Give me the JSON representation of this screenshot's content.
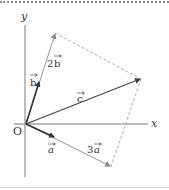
{
  "diagram": {
    "type": "vector-decomposition",
    "axes": {
      "x_label": "x",
      "y_label": "y",
      "origin_label": "O"
    },
    "vectors": [
      {
        "name": "a",
        "label": "a",
        "role": "unit vector a"
      },
      {
        "name": "b",
        "label": "b",
        "role": "unit vector b"
      },
      {
        "name": "3a",
        "label": "3a",
        "coef": "3",
        "base": "a"
      },
      {
        "name": "2b",
        "label": "2b",
        "coef": "2",
        "base": "b"
      },
      {
        "name": "c",
        "label": "c",
        "role": "resultant c = 3a + 2b"
      }
    ],
    "labels": {
      "a_base": "a",
      "b_base": "b",
      "three": "3",
      "two": "2",
      "c": "c"
    },
    "colors": {
      "axis": "#7a7a7a",
      "vector_dark": "#333333",
      "vector_light": "#8a8a8a",
      "dashed": "#9a9a9a"
    }
  }
}
